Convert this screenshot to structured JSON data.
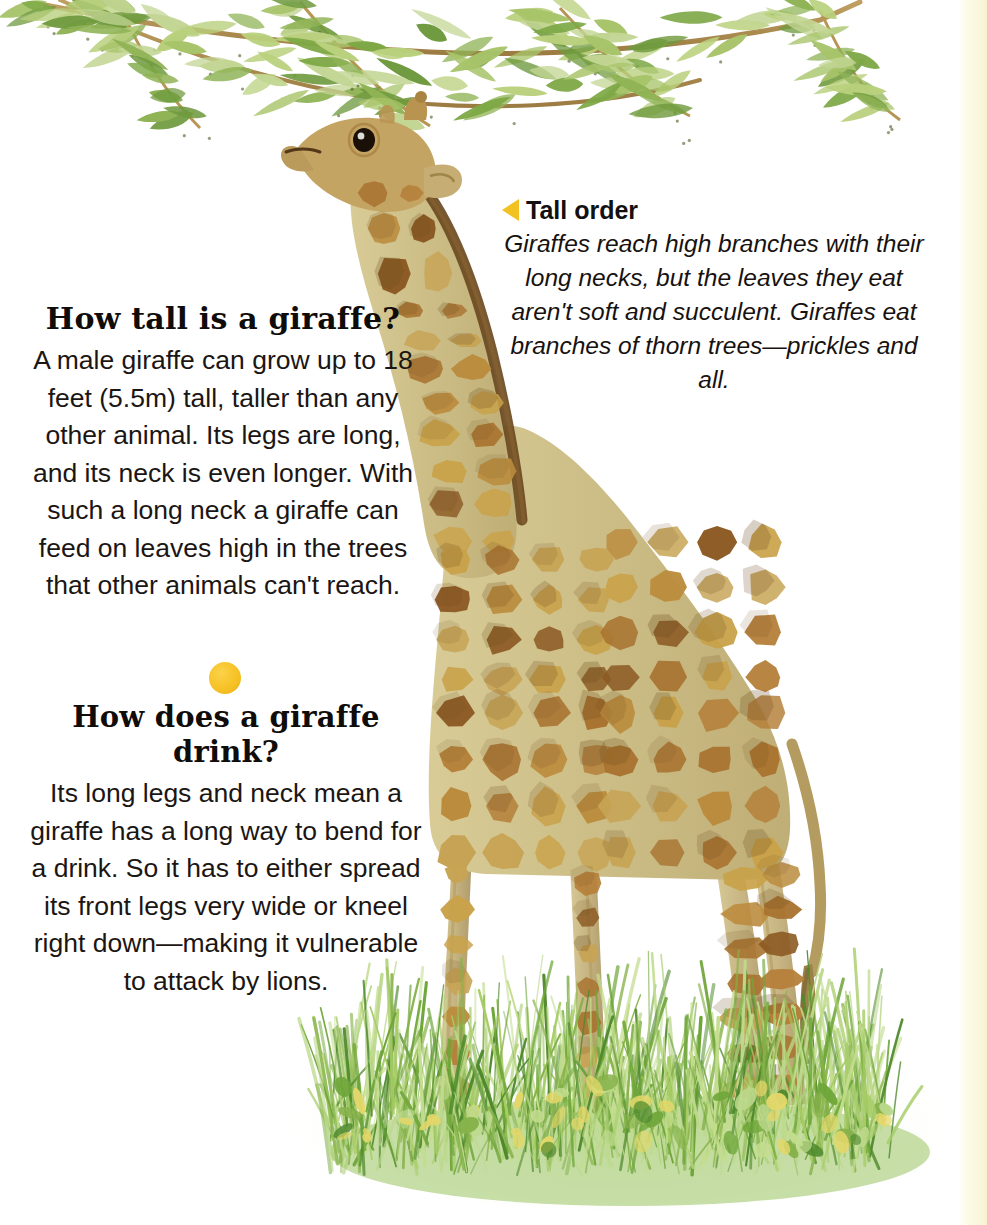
{
  "page": {
    "background_color": "#ffffff",
    "edge_strip_color": "#f7f2cf"
  },
  "sections": {
    "tall": {
      "heading": "How tall is a giraffe?",
      "body": "A male giraffe can grow up to 18 feet (5.5m) tall, taller than any other animal. Its legs are long, and its neck is even longer. With such a long neck a giraffe can feed on leaves high in the trees that other animals can't reach."
    },
    "separator": {
      "shape": "circle",
      "color": "#f6c225"
    },
    "drink": {
      "heading": "How does a giraffe drink?",
      "body": "Its long legs and neck mean a giraffe has a long way to bend for a drink. So it has to either spread its front legs very wide or kneel right down—making it vulnerable to attack by lions."
    },
    "caption": {
      "marker_icon": "left-triangle-icon",
      "marker_color": "#f2c223",
      "heading": "Tall order",
      "body": "Giraffes reach high branches with their long necks, but the leaves they eat aren't soft and succulent. Giraffes eat branches of thorn trees—prickles and all."
    }
  },
  "illustration": {
    "subject": "giraffe",
    "description": "Painted giraffe standing in grass, head raised to willow-like foliage hanging from the top of the page",
    "colors": {
      "coat_patch_light": "#c9a24a",
      "coat_patch_mid": "#b5803a",
      "coat_patch_dark": "#8c5a24",
      "coat_base": "#cfc08a",
      "coat_border": "#f3efe0",
      "mane": "#6b4a22",
      "leaf_light": "#b9d07c",
      "leaf_mid": "#8fb355",
      "leaf_dark": "#6f9a3e",
      "branch": "#b79554",
      "grass_light": "#c3dd8e",
      "grass_mid": "#86b24a",
      "grass_dark": "#4f8a2e",
      "grass_accent_yellow": "#e3d76a",
      "hoof": "#a0763c"
    }
  }
}
